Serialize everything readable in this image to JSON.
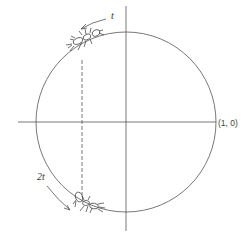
{
  "diagram": {
    "type": "unit-circle",
    "labels": {
      "top_arc": "t",
      "bottom_arc": "2t",
      "point": "(1, 0)"
    },
    "colors": {
      "stroke": "#555555",
      "ink": "#333333",
      "background": "#ffffff"
    },
    "figures": [
      "ant-top",
      "ant-bottom"
    ]
  }
}
